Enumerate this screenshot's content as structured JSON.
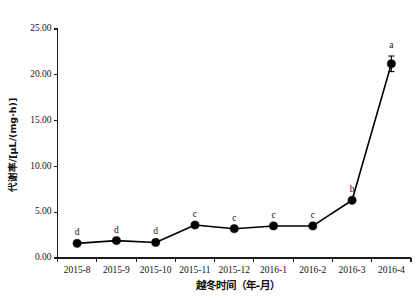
{
  "chart_data": {
    "type": "line",
    "title": "",
    "xlabel": "越冬时间（年-月）",
    "ylabel": "代谢率/[μL/(mg·h)]",
    "categories": [
      "2015-8",
      "2015-9",
      "2015-10",
      "2015-11",
      "2015-12",
      "2016-1",
      "2016-2",
      "2016-3",
      "2016-4"
    ],
    "values": [
      1.6,
      1.9,
      1.7,
      3.6,
      3.2,
      3.5,
      3.5,
      6.3,
      21.2
    ],
    "errors": [
      0.0,
      0.0,
      0.0,
      0.0,
      0.0,
      0.0,
      0.0,
      0.0,
      0.85
    ],
    "annotations": [
      "d",
      "d",
      "d",
      "c",
      "c",
      "c",
      "c",
      "b",
      "a"
    ],
    "ylim": [
      0,
      25
    ],
    "ytick_labels": [
      "0.00",
      "5.00",
      "10.00",
      "15.00",
      "20.00",
      "25.00"
    ],
    "ytick_values": [
      0,
      5,
      10,
      15,
      20,
      25
    ],
    "grid": false,
    "legend": "none",
    "marker": "filled-circle",
    "line_color": "#000000",
    "marker_color": "#000000"
  }
}
